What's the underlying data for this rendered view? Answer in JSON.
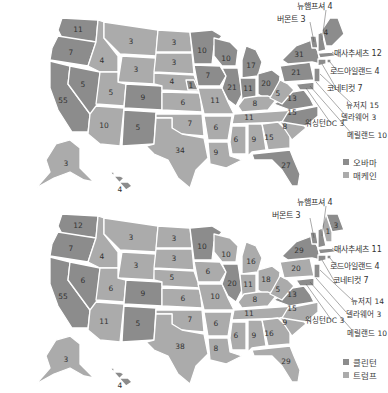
{
  "colors": {
    "dem": "#8c8c8c",
    "rep": "#ababab",
    "border": "#ffffff",
    "text": "#333333"
  },
  "maps": [
    {
      "id": "2008",
      "legend": [
        {
          "label": "오바마",
          "party": "dem",
          "color": "#8c8c8c"
        },
        {
          "label": "매케인",
          "party": "rep",
          "color": "#ababab"
        }
      ],
      "callouts": {
        "nh": "뉴햄프셔 4",
        "vt": "버몬트 3",
        "ma": "매사추세츠 12",
        "ri": "로드아일랜드 4",
        "ct": "코네티컷 7",
        "nj": "뉴저지 15",
        "de": "델라웨어 3",
        "dc": "워싱턴DC 3",
        "md": "메릴랜드 10"
      },
      "states": {
        "WA": "11",
        "OR": "7",
        "CA": "55",
        "NV": "5",
        "ID": "4",
        "MT": "3",
        "WY": "3",
        "UT": "5",
        "AZ": "10",
        "CO": "9",
        "NM": "5",
        "ND": "3",
        "SD": "3",
        "NE": "4",
        "NE2": "1",
        "KS": "6",
        "OK": "7",
        "TX": "34",
        "MN": "10",
        "IA": "7",
        "MO": "11",
        "AR": "6",
        "LA": "9",
        "WI": "10",
        "IL": "21",
        "MI": "17",
        "IN": "11",
        "OH": "20",
        "KY": "8",
        "TN": "11",
        "MS": "6",
        "AL": "9",
        "GA": "15",
        "FL": "27",
        "SC": "8",
        "NC": "15",
        "VA": "13",
        "WV": "5",
        "PA": "21",
        "NY": "31",
        "ME": "4",
        "AK": "3",
        "HI": "4"
      }
    },
    {
      "id": "2016",
      "legend": [
        {
          "label": "클린턴",
          "party": "dem",
          "color": "#8c8c8c"
        },
        {
          "label": "트럼프",
          "party": "rep",
          "color": "#ababab"
        }
      ],
      "callouts": {
        "nh": "뉴햄프셔 4",
        "vt": "버몬트 3",
        "ma": "매사추세츠 11",
        "ri": "로드아일랜드 4",
        "ct": "코네티컷 7",
        "nj": "뉴저지 14",
        "de": "델라웨어 3",
        "dc": "워싱턴DC 3",
        "md": "메릴랜드 10"
      },
      "states": {
        "WA": "12",
        "OR": "7",
        "CA": "55",
        "NV": "6",
        "ID": "4",
        "MT": "3",
        "WY": "3",
        "UT": "6",
        "AZ": "11",
        "CO": "9",
        "NM": "5",
        "ND": "3",
        "SD": "3",
        "NE": "5",
        "KS": "6",
        "OK": "7",
        "TX": "38",
        "MN": "10",
        "IA": "6",
        "MO": "10",
        "AR": "6",
        "LA": "8",
        "WI": "10",
        "IL": "20",
        "MI": "16",
        "IN": "11",
        "OH": "18",
        "KY": "8",
        "TN": "11",
        "MS": "6",
        "AL": "9",
        "GA": "16",
        "FL": "29",
        "SC": "9",
        "NC": "15",
        "VA": "13",
        "WV": "5",
        "PA": "20",
        "NY": "29",
        "ME": "3",
        "ME2": "1",
        "AK": "3",
        "HI": "4"
      }
    }
  ]
}
